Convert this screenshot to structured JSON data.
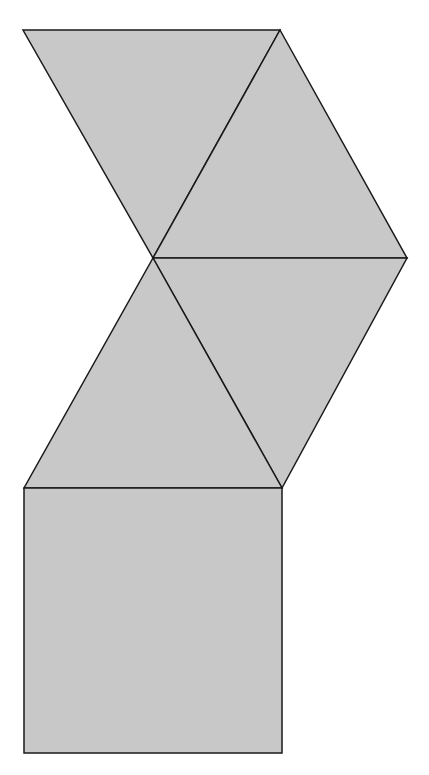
{
  "diagram": {
    "type": "net-of-solid",
    "colors": {
      "fill": "#c8c8c8",
      "stroke": "#1a1a1a",
      "background": "#ffffff"
    },
    "faces": [
      {
        "id": "triangle-1",
        "shape": "triangle",
        "points": [
          [
            23,
            30
          ],
          [
            280,
            30
          ],
          [
            153,
            258
          ]
        ]
      },
      {
        "id": "triangle-2",
        "shape": "triangle",
        "points": [
          [
            280,
            30
          ],
          [
            407,
            258
          ],
          [
            153,
            258
          ]
        ]
      },
      {
        "id": "triangle-3",
        "shape": "triangle",
        "points": [
          [
            153,
            258
          ],
          [
            407,
            258
          ],
          [
            282,
            488
          ]
        ]
      },
      {
        "id": "triangle-4",
        "shape": "triangle",
        "points": [
          [
            153,
            258
          ],
          [
            282,
            488
          ],
          [
            24,
            488
          ]
        ]
      },
      {
        "id": "square-base",
        "shape": "square",
        "points": [
          [
            24,
            488
          ],
          [
            282,
            488
          ],
          [
            282,
            753
          ],
          [
            24,
            753
          ]
        ]
      }
    ]
  }
}
